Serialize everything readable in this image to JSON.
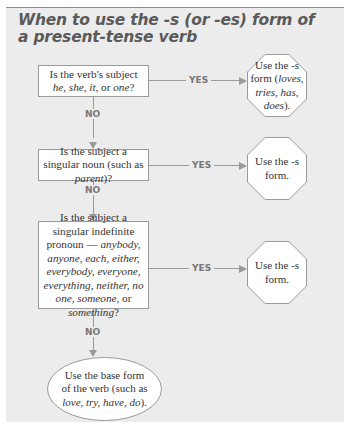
{
  "title": "When to use the -s (or -es) form of a present-tense verb",
  "flowchart": {
    "decisions": [
      {
        "id": "q1",
        "parts": [
          {
            "text": "Is the verb's subject ",
            "italic": false
          },
          {
            "text": "he,",
            "italic": true
          },
          {
            "text": " ",
            "italic": false
          },
          {
            "text": "she, it,",
            "italic": true
          },
          {
            "text": " or ",
            "italic": false
          },
          {
            "text": "one",
            "italic": true
          },
          {
            "text": "?",
            "italic": false
          }
        ],
        "yes_label": "YES",
        "no_label": "NO"
      },
      {
        "id": "q2",
        "parts": [
          {
            "text": "Is the subject a singular noun (such as ",
            "italic": false
          },
          {
            "text": "parent",
            "italic": true
          },
          {
            "text": ")?",
            "italic": false
          }
        ],
        "yes_label": "YES",
        "no_label": "NO"
      },
      {
        "id": "q3",
        "parts": [
          {
            "text": "Is the subject a singular indefinite pronoun — ",
            "italic": false
          },
          {
            "text": "anybody, anyone, each, either, everybody, everyone, everything, neither, no one, someone,",
            "italic": true
          },
          {
            "text": " or ",
            "italic": false
          },
          {
            "text": "something",
            "italic": true
          },
          {
            "text": "?",
            "italic": false
          }
        ],
        "yes_label": "YES",
        "no_label": "NO"
      }
    ],
    "outcomes": [
      {
        "id": "o1",
        "parts": [
          {
            "text": "Use the -s form (",
            "italic": false
          },
          {
            "text": "loves, tries, has, does",
            "italic": true
          },
          {
            "text": ").",
            "italic": false
          }
        ]
      },
      {
        "id": "o2",
        "parts": [
          {
            "text": "Use the -s form.",
            "italic": false
          }
        ]
      },
      {
        "id": "o3",
        "parts": [
          {
            "text": "Use the -s form.",
            "italic": false
          }
        ]
      }
    ],
    "final": {
      "parts": [
        {
          "text": "Use the base form of the verb (such as ",
          "italic": false
        },
        {
          "text": "love, try, have, do",
          "italic": true
        },
        {
          "text": ").",
          "italic": false
        }
      ]
    }
  },
  "colors": {
    "panel_bg": "#ececec",
    "line": "#9a9a9a",
    "title": "#5a5a5a",
    "label": "#777777"
  }
}
